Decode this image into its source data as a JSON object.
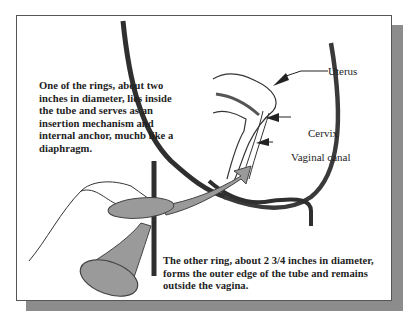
{
  "diagram": {
    "type": "anatomical illustration",
    "labels": {
      "uterus": "Uterus",
      "cervix": "Cervix",
      "vaginal_canal": "Vaginal canal"
    },
    "captions": {
      "inner_ring": "One of the rings, about two inches in diameter, lies inside the tube and serves as an insertion mechanism and internal anchor, muchb like a diaphragm.",
      "outer_ring": "The other ring, about 2 3/4 inches in diameter, forms the outer edge of the tube and remains outside the vagina."
    },
    "colors": {
      "outline": "#2b2b2b",
      "device_fill": "#9a9a9a",
      "frame_shadow": "#8c8c8c",
      "background": "#ffffff"
    }
  }
}
